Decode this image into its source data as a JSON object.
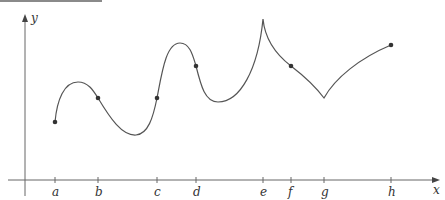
{
  "figure": {
    "axes": {
      "x_label": "x",
      "y_label": "y",
      "origin": [
        25,
        180
      ],
      "x_axis_end": 440,
      "y_axis_top": 15
    },
    "ticks": [
      {
        "label": "a",
        "x": 55
      },
      {
        "label": "b",
        "x": 98
      },
      {
        "label": "c",
        "x": 157
      },
      {
        "label": "d",
        "x": 196
      },
      {
        "label": "e",
        "x": 263
      },
      {
        "label": "f",
        "x": 291
      },
      {
        "label": "g",
        "x": 324
      },
      {
        "label": "h",
        "x": 391
      }
    ],
    "marked_points": [
      {
        "at": "a",
        "x": 55,
        "y": 122
      },
      {
        "at": "b",
        "x": 98,
        "y": 98
      },
      {
        "at": "c",
        "x": 157,
        "y": 98
      },
      {
        "at": "d",
        "x": 196,
        "y": 66
      },
      {
        "at": "f",
        "x": 291,
        "y": 66
      },
      {
        "at": "h",
        "x": 391,
        "y": 45
      }
    ],
    "features": {
      "cusp_at": "e",
      "corner_at": "g"
    },
    "colors": {
      "curve": "#555555",
      "axis": "#666666",
      "point": "#333333"
    }
  }
}
